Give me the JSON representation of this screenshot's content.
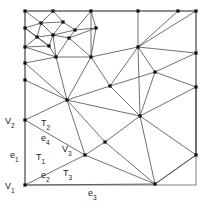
{
  "diagram": {
    "type": "triangulation-mesh",
    "canvas": {
      "width": 207,
      "height": 205
    },
    "frame": {
      "name": "domain-boundary-square",
      "left": 25,
      "top": 11,
      "right": 196,
      "bottom": 185,
      "color": "#888888"
    },
    "style": {
      "edge_color": "#333333",
      "vertex_color": "#111111",
      "frame_color": "#888888",
      "background": "#ffffff",
      "vertex_size": 3.2
    },
    "labels": [
      {
        "id": "V1",
        "base": "V",
        "sub": "1",
        "x": 5,
        "y": 189,
        "anchor": "start"
      },
      {
        "id": "V2",
        "base": "V",
        "sub": "2",
        "x": 5,
        "y": 124,
        "anchor": "start"
      },
      {
        "id": "V3",
        "base": "V",
        "sub": "3",
        "x": 62,
        "y": 152,
        "anchor": "start"
      },
      {
        "id": "e1",
        "base": "e",
        "sub": "1",
        "x": 10,
        "y": 158,
        "anchor": "start"
      },
      {
        "id": "e2",
        "base": "e",
        "sub": "2",
        "x": 41,
        "y": 178,
        "anchor": "start"
      },
      {
        "id": "e3",
        "base": "e",
        "sub": "3",
        "x": 88,
        "y": 196,
        "anchor": "start"
      },
      {
        "id": "e4",
        "base": "e",
        "sub": "4",
        "x": 41,
        "y": 141,
        "anchor": "start"
      },
      {
        "id": "T1",
        "base": "T",
        "sub": "1",
        "x": 36,
        "y": 160,
        "anchor": "start"
      },
      {
        "id": "T2",
        "base": "T",
        "sub": "2",
        "x": 41,
        "y": 126,
        "anchor": "start"
      },
      {
        "id": "T3",
        "base": "T",
        "sub": "3",
        "x": 63,
        "y": 176,
        "anchor": "start"
      }
    ],
    "vertices": [
      {
        "id": "v0",
        "x": 25,
        "y": 11
      },
      {
        "id": "v1",
        "x": 53,
        "y": 11
      },
      {
        "id": "v2",
        "x": 91,
        "y": 11
      },
      {
        "id": "v3",
        "x": 138,
        "y": 11
      },
      {
        "id": "v4",
        "x": 178,
        "y": 11
      },
      {
        "id": "v5",
        "x": 196,
        "y": 11
      },
      {
        "id": "v6",
        "x": 25,
        "y": 28
      },
      {
        "id": "v7",
        "x": 41,
        "y": 23
      },
      {
        "id": "v8",
        "x": 63,
        "y": 22
      },
      {
        "id": "v9",
        "x": 75,
        "y": 30
      },
      {
        "id": "v10",
        "x": 96,
        "y": 28
      },
      {
        "id": "v11",
        "x": 25,
        "y": 47
      },
      {
        "id": "v12",
        "x": 37,
        "y": 37
      },
      {
        "id": "v13",
        "x": 53,
        "y": 35
      },
      {
        "id": "v14",
        "x": 69,
        "y": 38
      },
      {
        "id": "v15",
        "x": 49,
        "y": 46
      },
      {
        "id": "v16",
        "x": 25,
        "y": 63
      },
      {
        "id": "v17",
        "x": 56,
        "y": 57
      },
      {
        "id": "v18",
        "x": 91,
        "y": 57
      },
      {
        "id": "v19",
        "x": 138,
        "y": 47
      },
      {
        "id": "v20",
        "x": 196,
        "y": 53
      },
      {
        "id": "v21",
        "x": 155,
        "y": 72
      },
      {
        "id": "v22",
        "x": 25,
        "y": 80
      },
      {
        "id": "v23",
        "x": 196,
        "y": 87
      },
      {
        "id": "v24",
        "x": 110,
        "y": 86
      },
      {
        "id": "v25",
        "x": 67,
        "y": 100
      },
      {
        "id": "v26",
        "x": 140,
        "y": 116
      },
      {
        "id": "v27",
        "x": 25,
        "y": 120
      },
      {
        "id": "v28",
        "x": 85,
        "y": 155
      },
      {
        "id": "v29",
        "x": 105,
        "y": 142
      },
      {
        "id": "v30",
        "x": 196,
        "y": 155
      },
      {
        "id": "v31",
        "x": 25,
        "y": 185
      },
      {
        "id": "v32",
        "x": 155,
        "y": 184
      }
    ],
    "edges": [
      [
        "v0",
        "v1"
      ],
      [
        "v1",
        "v2"
      ],
      [
        "v2",
        "v3"
      ],
      [
        "v3",
        "v4"
      ],
      [
        "v4",
        "v5"
      ],
      [
        "v0",
        "v6"
      ],
      [
        "v6",
        "v11"
      ],
      [
        "v11",
        "v16"
      ],
      [
        "v16",
        "v22"
      ],
      [
        "v22",
        "v27"
      ],
      [
        "v27",
        "v31"
      ],
      [
        "v5",
        "v20"
      ],
      [
        "v20",
        "v23"
      ],
      [
        "v23",
        "v30"
      ],
      [
        "v31",
        "v32"
      ],
      [
        "v32",
        "v30"
      ],
      [
        "v0",
        "v7"
      ],
      [
        "v6",
        "v7"
      ],
      [
        "v7",
        "v8"
      ],
      [
        "v1",
        "v8"
      ],
      [
        "v1",
        "v7"
      ],
      [
        "v8",
        "v9"
      ],
      [
        "v9",
        "v10"
      ],
      [
        "v2",
        "v10"
      ],
      [
        "v2",
        "v9"
      ],
      [
        "v6",
        "v12"
      ],
      [
        "v7",
        "v12"
      ],
      [
        "v12",
        "v13"
      ],
      [
        "v8",
        "v13"
      ],
      [
        "v7",
        "v13"
      ],
      [
        "v13",
        "v14"
      ],
      [
        "v9",
        "v14"
      ],
      [
        "v13",
        "v9"
      ],
      [
        "v6",
        "v15"
      ],
      [
        "v12",
        "v15"
      ],
      [
        "v15",
        "v13"
      ],
      [
        "v11",
        "v15"
      ],
      [
        "v11",
        "v12"
      ],
      [
        "v15",
        "v17"
      ],
      [
        "v13",
        "v17"
      ],
      [
        "v14",
        "v17"
      ],
      [
        "v14",
        "v10"
      ],
      [
        "v10",
        "v18"
      ],
      [
        "v14",
        "v18"
      ],
      [
        "v17",
        "v18"
      ],
      [
        "v11",
        "v17"
      ],
      [
        "v16",
        "v17"
      ],
      [
        "v18",
        "v19"
      ],
      [
        "v3",
        "v19"
      ],
      [
        "v2",
        "v18"
      ],
      [
        "v19",
        "v5"
      ],
      [
        "v19",
        "v4"
      ],
      [
        "v19",
        "v20"
      ],
      [
        "v19",
        "v21"
      ],
      [
        "v21",
        "v20"
      ],
      [
        "v21",
        "v23"
      ],
      [
        "v18",
        "v24"
      ],
      [
        "v24",
        "v19"
      ],
      [
        "v24",
        "v21"
      ],
      [
        "v16",
        "v25"
      ],
      [
        "v22",
        "v25"
      ],
      [
        "v25",
        "v17"
      ],
      [
        "v25",
        "v18"
      ],
      [
        "v25",
        "v24"
      ],
      [
        "v25",
        "v26"
      ],
      [
        "v24",
        "v26"
      ],
      [
        "v19",
        "v26"
      ],
      [
        "v21",
        "v26"
      ],
      [
        "v25",
        "v27"
      ],
      [
        "v27",
        "v28"
      ],
      [
        "v25",
        "v28"
      ],
      [
        "v28",
        "v29"
      ],
      [
        "v29",
        "v26"
      ],
      [
        "v25",
        "v29"
      ],
      [
        "v26",
        "v30"
      ],
      [
        "v26",
        "v32"
      ],
      [
        "v29",
        "v32"
      ],
      [
        "v28",
        "v32"
      ],
      [
        "v28",
        "v31"
      ],
      [
        "v30",
        "v32"
      ],
      [
        "v23",
        "v30"
      ],
      [
        "v26",
        "v23"
      ]
    ]
  }
}
